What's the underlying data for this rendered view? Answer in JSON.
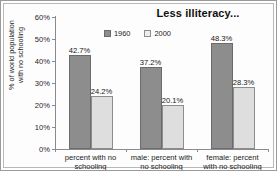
{
  "chart_data": {
    "type": "bar",
    "title": "Less illiteracy...",
    "xlabel": "",
    "ylabel_line1": "% of world population",
    "ylabel_line2": "with no schooling",
    "categories": [
      "percent with no schooling",
      "male: percent with no schooling",
      "female: percent with no schooling"
    ],
    "category_lines": [
      [
        "percent with no",
        "schooling"
      ],
      [
        "male: percent with",
        "no schooling"
      ],
      [
        "female: percent",
        "with no schooling"
      ]
    ],
    "series": [
      {
        "name": "1960",
        "color": "#8d8d8d",
        "values": [
          42.7,
          37.2,
          48.3
        ],
        "labels": [
          "42.7%",
          "37.2%",
          "48.3%"
        ]
      },
      {
        "name": "2000",
        "color": "#dedede",
        "values": [
          24.2,
          20.1,
          28.3
        ],
        "labels": [
          "24.2%",
          "20.1%",
          "28.3%"
        ]
      }
    ],
    "ylim": [
      0,
      60
    ],
    "ytick_values": [
      0,
      10,
      20,
      30,
      40,
      50,
      60
    ],
    "ytick_labels": [
      "0%",
      "10%",
      "20%",
      "30%",
      "40%",
      "50%",
      "60%"
    ],
    "grid": false,
    "legend_position": "top-center"
  }
}
